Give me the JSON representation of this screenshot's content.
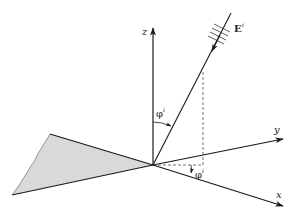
{
  "diagram": {
    "colors": {
      "line": "#1a1a1a",
      "wedge_fill": "#d9d9d9",
      "background": "#ffffff"
    },
    "axes": {
      "x": {
        "label": "x"
      },
      "y": {
        "label": "y"
      },
      "z": {
        "label": "z"
      }
    },
    "incident_field": {
      "label": "E",
      "superscript": "i"
    },
    "angles": {
      "polar": {
        "symbol": "φ",
        "superscript": "i"
      },
      "azimuth": {
        "symbol": "φ",
        "superscript": "i"
      }
    }
  }
}
